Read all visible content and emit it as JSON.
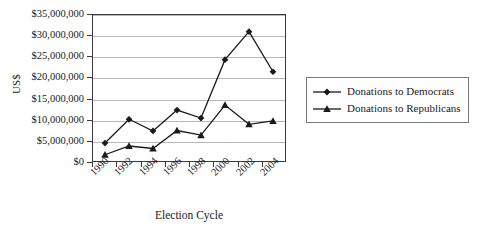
{
  "chart_data": {
    "type": "line",
    "title": "",
    "xlabel": "Election Cycle",
    "ylabel": "US$",
    "x": [
      1991,
      1993,
      1995,
      1997,
      1999,
      2001,
      2003,
      2005
    ],
    "xtick_labels": [
      "1990",
      "1992",
      "1994",
      "1996",
      "1998",
      "2000",
      "2002",
      "2004"
    ],
    "xtick_values": [
      1990,
      1992,
      1994,
      1996,
      1998,
      2000,
      2002,
      2004
    ],
    "xlim": [
      1990,
      2006
    ],
    "ylim": [
      0,
      35000000
    ],
    "ytick_labels": [
      "$0",
      "$5,000,000",
      "$10,000,000",
      "$15,000,000",
      "$20,000,000",
      "$25,000,000",
      "$30,000,000",
      "$35,000,000"
    ],
    "ytick_values": [
      0,
      5000000,
      10000000,
      15000000,
      20000000,
      25000000,
      30000000,
      35000000
    ],
    "grid": "horizontal",
    "legend_position": "right",
    "series": [
      {
        "name": "Donations to Democrats",
        "marker": "diamond",
        "color": "#1a1a1a",
        "values": [
          4300000,
          10000000,
          7200000,
          12200000,
          10300000,
          24300000,
          31000000,
          21400000
        ]
      },
      {
        "name": "Donations to Republicans",
        "marker": "triangle",
        "color": "#1a1a1a",
        "values": [
          1500000,
          3600000,
          3000000,
          7300000,
          6200000,
          13400000,
          8800000,
          9600000
        ]
      }
    ]
  }
}
